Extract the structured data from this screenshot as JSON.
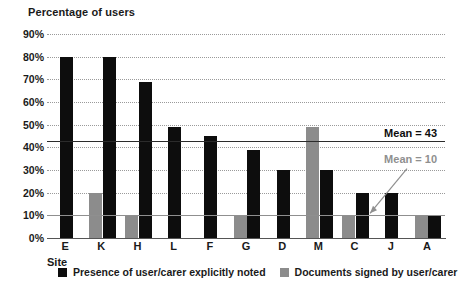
{
  "chart_data": {
    "type": "bar",
    "title": "Percentage of users",
    "xlabel": "Site",
    "ylabel": "Percentage of users",
    "ylim": [
      0,
      90
    ],
    "ytick_labels": [
      "90%",
      "80%",
      "70%",
      "60%",
      "50%",
      "40%",
      "30%",
      "20%",
      "10%",
      "0%"
    ],
    "ytick_values": [
      90,
      80,
      70,
      60,
      50,
      40,
      30,
      20,
      10,
      0
    ],
    "grid": true,
    "legend_position": "bottom",
    "categories": [
      "E",
      "K",
      "H",
      "L",
      "F",
      "G",
      "D",
      "M",
      "C",
      "J",
      "A"
    ],
    "series": [
      {
        "name": "Presence of user/carer explicitly noted",
        "color": "#0d0d0d",
        "values": [
          80,
          80,
          69,
          49,
          45,
          39,
          30,
          30,
          20,
          20,
          10
        ]
      },
      {
        "name": "Documents signed by user/carer",
        "color": "#8c8c8c",
        "values": [
          0,
          20,
          10,
          0,
          0,
          10,
          0,
          49,
          10,
          0,
          10
        ]
      }
    ],
    "annotations": [
      {
        "id": "mean-dark",
        "label": "Mean = 43",
        "value": 43,
        "color": "#0d0d0d",
        "kind": "reference-line"
      },
      {
        "id": "mean-light",
        "label": "Mean = 10",
        "value": 10,
        "color": "#8f8f8f",
        "kind": "reference-line"
      }
    ]
  },
  "legend": {
    "items": [
      {
        "label": "Presence of user/carer explicitly noted",
        "swatch": "black"
      },
      {
        "label": "Documents signed by user/carer",
        "swatch": "gray"
      }
    ]
  }
}
